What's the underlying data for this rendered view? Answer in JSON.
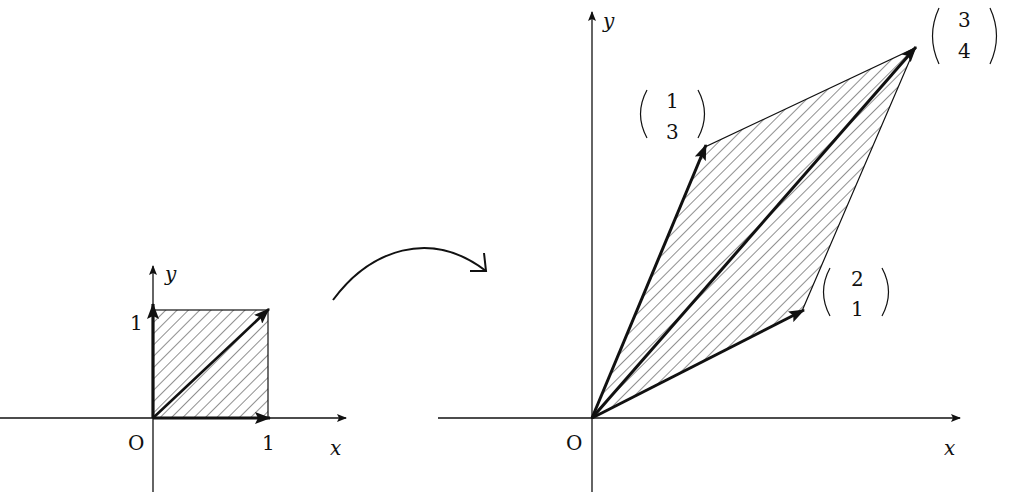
{
  "diagram": {
    "left_figure": {
      "origin_label": "O",
      "x_axis_label": "x",
      "y_axis_label": "y",
      "x_tick_label": "1",
      "y_tick_label": "1",
      "vectors": [
        [
          1,
          0
        ],
        [
          0,
          1
        ],
        [
          1,
          1
        ]
      ],
      "shape": "unit square (hatched)"
    },
    "transform_arrow": "curved arrow pointing right",
    "right_figure": {
      "origin_label": "O",
      "x_axis_label": "x",
      "y_axis_label": "y",
      "vectors": [
        {
          "top": "2",
          "bottom": "1"
        },
        {
          "top": "1",
          "bottom": "3"
        },
        {
          "top": "3",
          "bottom": "4"
        }
      ],
      "shape": "parallelogram (hatched)"
    },
    "colors": {
      "ink": "#111111",
      "background": "#ffffff"
    }
  }
}
